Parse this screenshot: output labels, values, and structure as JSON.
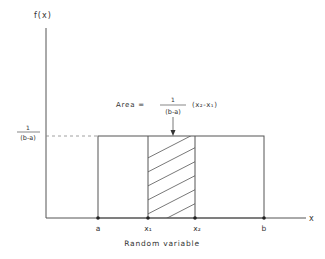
{
  "diagram": {
    "type": "uniform-distribution-pdf",
    "y_axis_label": "f(x)",
    "x_axis_label": "x",
    "x_axis_title": "Random variable",
    "height_label_num": "1",
    "height_label_den": "(b-a)",
    "area_label_prefix": "Area =",
    "area_label_num": "1",
    "area_label_den": "(b-a)",
    "area_label_suffix": "(x₂-x₁)",
    "points": [
      {
        "label": "a"
      },
      {
        "label": "x₁"
      },
      {
        "label": "x₂"
      },
      {
        "label": "b"
      }
    ],
    "colors": {
      "line": "#444444",
      "text": "#333333",
      "dashed": "#888888"
    }
  }
}
